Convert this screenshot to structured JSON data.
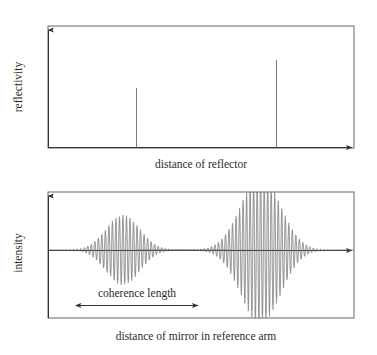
{
  "figure": {
    "title_visible": false,
    "background": "#ffffff",
    "ink_color": "#2b2b2b"
  },
  "top_plot": {
    "name": "reflectivity-plot",
    "ylabel": "reflectivity",
    "xlabel": "distance of reflector",
    "frame": {
      "x": 48,
      "y": 26,
      "width": 306,
      "height": 122
    },
    "y_arrow": true,
    "x_arrow": true
  },
  "bottom_plot": {
    "name": "interferogram-plot",
    "ylabel": "intensity",
    "xlabel": "distance of mirror in reference arm",
    "annotation": "coherence length",
    "frame": {
      "x": 48,
      "y": 192,
      "width": 306,
      "height": 126
    },
    "y_arrow": true,
    "x_arrow": true,
    "baseline_y": 250
  },
  "chart_data": [
    {
      "type": "bar",
      "name": "reflectivity-vs-distance",
      "title": "",
      "xlabel": "distance of reflector",
      "ylabel": "reflectivity",
      "categories": [
        "reflector 1",
        "reflector 2"
      ],
      "x": [
        0.37,
        0.74
      ],
      "values": [
        0.49,
        0.72
      ],
      "xlim": [
        0,
        1
      ],
      "ylim": [
        0,
        1
      ],
      "grid": false,
      "legend": false,
      "notes": "Two delta-function style reflectivity spikes; second spike taller than the first."
    },
    {
      "type": "line",
      "name": "interference-signal-vs-mirror-distance",
      "title": "",
      "xlabel": "distance of mirror in reference arm",
      "ylabel": "intensity",
      "xlim": [
        0,
        1
      ],
      "ylim": [
        -1,
        1
      ],
      "grid": false,
      "legend": false,
      "series": [
        {
          "name": "wave packet 1",
          "center": 0.245,
          "envelope_sigma": 0.055,
          "amplitude": 0.45,
          "fringe_period": 0.0115
        },
        {
          "name": "wave packet 2",
          "center": 0.695,
          "envelope_sigma": 0.065,
          "amplitude": 0.95,
          "fringe_period": 0.0115
        }
      ],
      "annotations": [
        {
          "text": "coherence length",
          "type": "double-arrow",
          "x_start": 0.115,
          "x_end": 0.45,
          "y": -0.62
        }
      ],
      "notes": "Low-coherence interferogram: two Gaussian-enveloped fringe bursts, the second larger and clipped by the frame."
    }
  ]
}
